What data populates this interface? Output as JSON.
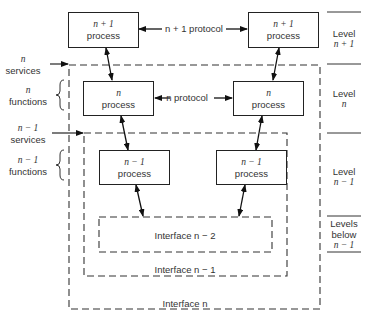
{
  "diagram": {
    "processes": {
      "n_plus_1_left": {
        "line1": "n + 1",
        "line2": "process"
      },
      "n_plus_1_right": {
        "line1": "n + 1",
        "line2": "process"
      },
      "n_left": {
        "line1": "n",
        "line2": "process"
      },
      "n_right": {
        "line1": "n",
        "line2": "process"
      },
      "n_minus_1_left": {
        "line1": "n − 1",
        "line2": "process"
      },
      "n_minus_1_right": {
        "line1": "n − 1",
        "line2": "process"
      }
    },
    "protocols": {
      "n_plus_1": "n + 1 protocol",
      "n": "n protocol"
    },
    "left_labels": {
      "n_services": {
        "line1": "n",
        "line2": "services"
      },
      "n_functions": {
        "line1": "n",
        "line2": "functions"
      },
      "n_minus_1_services": {
        "line1": "n − 1",
        "line2": "services"
      },
      "n_minus_1_functions": {
        "line1": "n − 1",
        "line2": "functions"
      }
    },
    "interfaces": {
      "n_minus_2": "Interface n − 2",
      "n_minus_1": "Interface n − 1",
      "n": "Interface n"
    },
    "levels": [
      {
        "line1": "Level",
        "line2": "n + 1",
        "line3": ""
      },
      {
        "line1": "Level",
        "line2": "n",
        "line3": ""
      },
      {
        "line1": "Level",
        "line2": "n − 1",
        "line3": ""
      },
      {
        "line1": "Levels",
        "line2": "below",
        "line3": "n − 1"
      }
    ]
  }
}
